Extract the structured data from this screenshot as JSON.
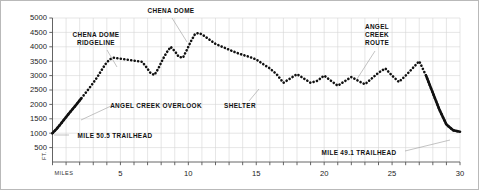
{
  "figure": {
    "background": "#ffffff",
    "border_color": "#b9b9b9"
  },
  "axes": {
    "y_axis_name": "FT.",
    "x_axis_name": "MILES",
    "y_ticks": [
      500,
      1000,
      1500,
      2000,
      2500,
      3000,
      3500,
      4000,
      4500,
      5000
    ],
    "y_tick_labels": [
      "500",
      "1000",
      "1500",
      "2000",
      "2500",
      "3000",
      "3500",
      "4000",
      "4500",
      "5000"
    ],
    "x_ticks": [
      0,
      1,
      2,
      3,
      4,
      5,
      6,
      7,
      8,
      9,
      10,
      11,
      12,
      13,
      14,
      15,
      16,
      17,
      18,
      19,
      20,
      21,
      22,
      23,
      24,
      25,
      26,
      27,
      28,
      29,
      30
    ],
    "x_tick_labels_shown": [
      "5",
      "10",
      "15",
      "20",
      "25",
      "30"
    ],
    "x_labeled_values": [
      5,
      10,
      15,
      20,
      25,
      30
    ],
    "grid_color": "#d5d5d5",
    "axis_color": "#555555",
    "series_color": "#111111"
  },
  "annotations": [
    {
      "id": "chena-dome",
      "text": "CHENA DOME",
      "lines": [
        "CHENA DOME"
      ],
      "x": 170,
      "y": 6,
      "align": "center",
      "leader": {
        "x1": 171,
        "y1": 17,
        "x2": 186,
        "y2": 41
      }
    },
    {
      "id": "chena-dome-ridgeline",
      "text": "CHENA DOME RIDGELINE",
      "lines": [
        "CHENA DOME",
        "RIDGELINE"
      ],
      "x": 95,
      "y": 30,
      "align": "center",
      "leader": {
        "x1": 106,
        "y1": 49,
        "x2": 116,
        "y2": 66
      }
    },
    {
      "id": "angel-creek-route",
      "text": "ANGEL CREEK ROUTE",
      "lines": [
        "ANGEL",
        "CREEK",
        "ROUTE"
      ],
      "x": 376,
      "y": 22,
      "align": "center",
      "leader": {
        "x1": 374,
        "y1": 50,
        "x2": 356,
        "y2": 78
      }
    },
    {
      "id": "angel-creek-overlook",
      "text": "ANGEL CREEK OVERLOOK",
      "lines": [
        "ANGEL CREEK OVERLOOK"
      ],
      "x": 155,
      "y": 101,
      "align": "center",
      "leader": {
        "x1": 110,
        "y1": 105,
        "x2": 80,
        "y2": 119
      }
    },
    {
      "id": "shelter",
      "text": "SHELTER",
      "lines": [
        "SHELTER"
      ],
      "x": 239,
      "y": 101,
      "align": "center",
      "leader": {
        "x1": 248,
        "y1": 100,
        "x2": 258,
        "y2": 88
      }
    },
    {
      "id": "mile-50-5-trailhead",
      "text": "MILE 50.5 TRAILHEAD",
      "lines": [
        "MILE 50.5 TRAILHEAD"
      ],
      "x": 114,
      "y": 131,
      "align": "center",
      "leader": {
        "x1": 68,
        "y1": 134,
        "x2": 53,
        "y2": 134
      }
    },
    {
      "id": "mile-49-1-trailhead",
      "text": "MILE 49.1 TRAILHEAD",
      "lines": [
        "MILE 49.1 TRAILHEAD"
      ],
      "x": 358,
      "y": 148,
      "align": "center",
      "leader": {
        "x1": 404,
        "y1": 150,
        "x2": 449,
        "y2": 139
      }
    }
  ],
  "chart_data": {
    "type": "line",
    "xlabel": "MILES",
    "ylabel": "FT.",
    "xlim": [
      0,
      30
    ],
    "ylim": [
      0,
      5000
    ],
    "grid": true,
    "legend": "none",
    "style": "dotted",
    "x": [
      0.0,
      0.3,
      0.6,
      0.9,
      1.2,
      1.5,
      1.8,
      2.1,
      2.4,
      2.7,
      3.0,
      3.3,
      3.6,
      3.9,
      4.2,
      4.5,
      4.8,
      5.1,
      5.4,
      5.7,
      6.0,
      6.3,
      6.6,
      6.9,
      7.2,
      7.5,
      7.8,
      8.1,
      8.4,
      8.7,
      9.0,
      9.3,
      9.6,
      9.9,
      10.2,
      10.5,
      10.8,
      11.1,
      11.4,
      11.7,
      12.0,
      12.5,
      13.0,
      13.5,
      14.0,
      14.5,
      15.0,
      15.5,
      16.0,
      16.5,
      17.0,
      17.5,
      18.0,
      18.5,
      19.0,
      19.5,
      20.0,
      20.5,
      21.0,
      21.5,
      22.0,
      22.5,
      23.0,
      23.5,
      24.0,
      24.5,
      25.0,
      25.5,
      26.0,
      26.5,
      27.0,
      27.5,
      28.0,
      28.5,
      29.0,
      29.5,
      30.0
    ],
    "y": [
      1000,
      1150,
      1320,
      1500,
      1680,
      1850,
      2020,
      2200,
      2380,
      2560,
      2750,
      2950,
      3180,
      3400,
      3560,
      3620,
      3600,
      3580,
      3560,
      3540,
      3520,
      3500,
      3480,
      3300,
      3100,
      3020,
      3250,
      3550,
      3800,
      4000,
      3850,
      3650,
      3620,
      3900,
      4200,
      4450,
      4480,
      4400,
      4300,
      4200,
      4100,
      4000,
      3900,
      3800,
      3720,
      3650,
      3560,
      3400,
      3250,
      3050,
      2750,
      2900,
      3050,
      2900,
      2750,
      2820,
      3000,
      2820,
      2650,
      2800,
      2950,
      2820,
      2700,
      2900,
      3100,
      3250,
      3000,
      2780,
      3000,
      3250,
      3500,
      3000,
      2400,
      1800,
      1300,
      1100,
      1050
    ],
    "peaks": [
      {
        "label": "CHENA DOME",
        "mile": 10.5,
        "elevation": 4450
      },
      {
        "label": "ANGEL CREEK ROUTE",
        "mile": 27.0,
        "elevation": 3500
      }
    ],
    "endpoints": [
      {
        "label": "MILE 50.5 TRAILHEAD",
        "mile": 0,
        "elevation": 1000
      },
      {
        "label": "MILE 49.1 TRAILHEAD",
        "mile": 30,
        "elevation": 1050
      }
    ]
  }
}
